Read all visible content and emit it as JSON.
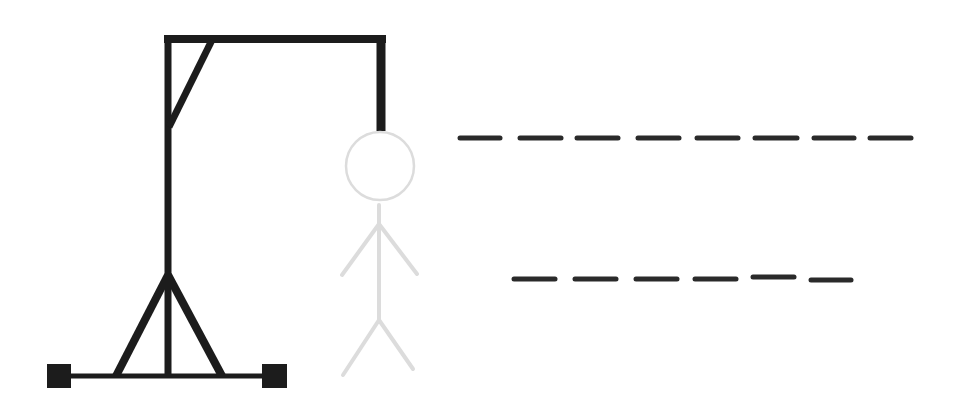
{
  "game": {
    "title": "Hangman",
    "colors": {
      "background": "#ffffff",
      "gallows": "#1c1c1c",
      "figure": "#dcdcdc",
      "blank": "#2a2a2a"
    },
    "gallows": {
      "base_line": {
        "x1": 59,
        "y1": 376,
        "x2": 275,
        "y2": 376,
        "width": 5
      },
      "base_blocks": [
        {
          "x": 47,
          "y": 364,
          "w": 24,
          "h": 24
        },
        {
          "x": 262,
          "y": 364,
          "w": 25,
          "h": 24
        }
      ],
      "supports": [
        {
          "x1": 168,
          "y1": 275,
          "x2": 116,
          "y2": 376,
          "width": 8
        },
        {
          "x1": 168,
          "y1": 275,
          "x2": 222,
          "y2": 376,
          "width": 8
        }
      ],
      "pole": {
        "x1": 168,
        "y1": 35,
        "x2": 168,
        "y2": 376,
        "width": 7
      },
      "beam": {
        "x1": 164,
        "y1": 39,
        "x2": 386,
        "y2": 39,
        "width": 8
      },
      "brace": {
        "x1": 212,
        "y1": 40,
        "x2": 169,
        "y2": 127,
        "width": 7
      },
      "rope": {
        "x1": 381,
        "y1": 35,
        "x2": 381,
        "y2": 131,
        "width": 9
      }
    },
    "figure": {
      "head": {
        "cx": 380,
        "cy": 166,
        "r": 34
      },
      "body": {
        "x1": 379,
        "y1": 205,
        "x2": 379,
        "y2": 322
      },
      "arms": [
        {
          "x1": 379,
          "y1": 224,
          "x2": 342,
          "y2": 275
        },
        {
          "x1": 379,
          "y1": 224,
          "x2": 417,
          "y2": 274
        }
      ],
      "legs": [
        {
          "x1": 379,
          "y1": 320,
          "x2": 343,
          "y2": 375
        },
        {
          "x1": 379,
          "y1": 320,
          "x2": 413,
          "y2": 369
        }
      ],
      "stroke_width": 4
    },
    "word": {
      "rows": [
        {
          "label": "Word 1",
          "letter_count": 8,
          "revealed": [
            "",
            "",
            "",
            "",
            "",
            "",
            "",
            ""
          ],
          "blanks": [
            {
              "x1": 460,
              "x2": 500,
              "y": 138
            },
            {
              "x1": 520,
              "x2": 561,
              "y": 138
            },
            {
              "x1": 577,
              "x2": 618,
              "y": 138
            },
            {
              "x1": 638,
              "x2": 679,
              "y": 138
            },
            {
              "x1": 697,
              "x2": 738,
              "y": 138
            },
            {
              "x1": 755,
              "x2": 797,
              "y": 138
            },
            {
              "x1": 814,
              "x2": 854,
              "y": 138
            },
            {
              "x1": 870,
              "x2": 911,
              "y": 138
            }
          ]
        },
        {
          "label": "Word 2",
          "letter_count": 6,
          "revealed": [
            "",
            "",
            "",
            "",
            "",
            ""
          ],
          "blanks": [
            {
              "x1": 514,
              "x2": 555,
              "y": 279
            },
            {
              "x1": 575,
              "x2": 616,
              "y": 279
            },
            {
              "x1": 636,
              "x2": 677,
              "y": 279
            },
            {
              "x1": 695,
              "x2": 736,
              "y": 279
            },
            {
              "x1": 753,
              "x2": 794,
              "y": 277
            },
            {
              "x1": 811,
              "x2": 851,
              "y": 280
            }
          ]
        }
      ]
    }
  }
}
